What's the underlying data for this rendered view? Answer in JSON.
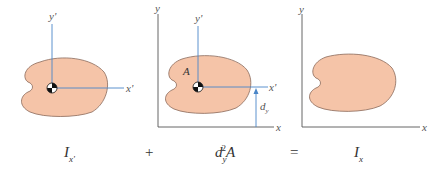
{
  "colors": {
    "shape_fill": "#F5C4A8",
    "shape_stroke": "#8A6A5A",
    "centroid_axis": "#4A86C8",
    "reference_axis": "#555555",
    "text": "#333333"
  },
  "panels": [
    {
      "id": "centroidal",
      "axis_labels": {
        "y": "y'",
        "x": "x'"
      },
      "has_centroid": true
    },
    {
      "id": "parallel-axis",
      "axis_labels": {
        "y": "y",
        "x": "x",
        "y_prime": "y'",
        "x_prime": "x'"
      },
      "area_label": "A",
      "distance_label": {
        "main": "d",
        "sub": "y"
      },
      "has_centroid": true
    },
    {
      "id": "reference",
      "axis_labels": {
        "y": "y",
        "x": "x"
      },
      "has_centroid": false
    }
  ],
  "equation": {
    "term1": {
      "main": "I",
      "sub": "x'"
    },
    "op1": "+",
    "term2": {
      "main": "d",
      "sub": "y",
      "sup": "2",
      "tail": "A"
    },
    "op2": "=",
    "term3": {
      "main": "I",
      "sub": "x"
    }
  }
}
